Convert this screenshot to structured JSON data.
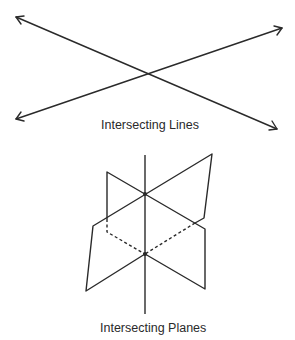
{
  "figures": {
    "lines": {
      "caption": "Intersecting Lines"
    },
    "planes": {
      "caption": "Intersecting Planes"
    }
  },
  "colors": {
    "stroke": "#2a2a2a",
    "background": "#ffffff"
  }
}
